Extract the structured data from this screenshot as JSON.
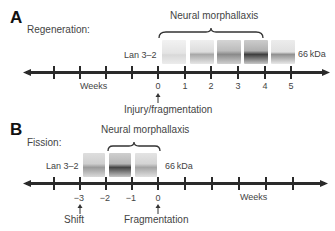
{
  "panel_a": {
    "letter": "A",
    "title": "Regeneration:",
    "brace_label": "Neural morphallaxis",
    "blot_label": "Lan 3–2",
    "kda_label": "66 kDa",
    "axis_label": "Weeks",
    "tick_labels": [
      "0",
      "1",
      "2",
      "3",
      "4",
      "5"
    ],
    "event_label": "Injury/fragmentation",
    "blot_intensities": [
      0.15,
      0.35,
      0.55,
      0.85,
      0.45
    ]
  },
  "panel_b": {
    "letter": "B",
    "title": "Fission:",
    "brace_label": "Neural morphallaxis",
    "blot_label": "Lan 3–2",
    "kda_label": "66 kDa",
    "axis_label": "Weeks",
    "tick_labels": [
      "−3",
      "−2",
      "−1",
      "0"
    ],
    "event_left_label": "Shift",
    "event_right_label": "Fragmentation",
    "blot_intensities": [
      0.45,
      0.85,
      0.4
    ]
  },
  "colors": {
    "axis": "#2a2a2a",
    "text": "#444444",
    "band": "#333333"
  }
}
